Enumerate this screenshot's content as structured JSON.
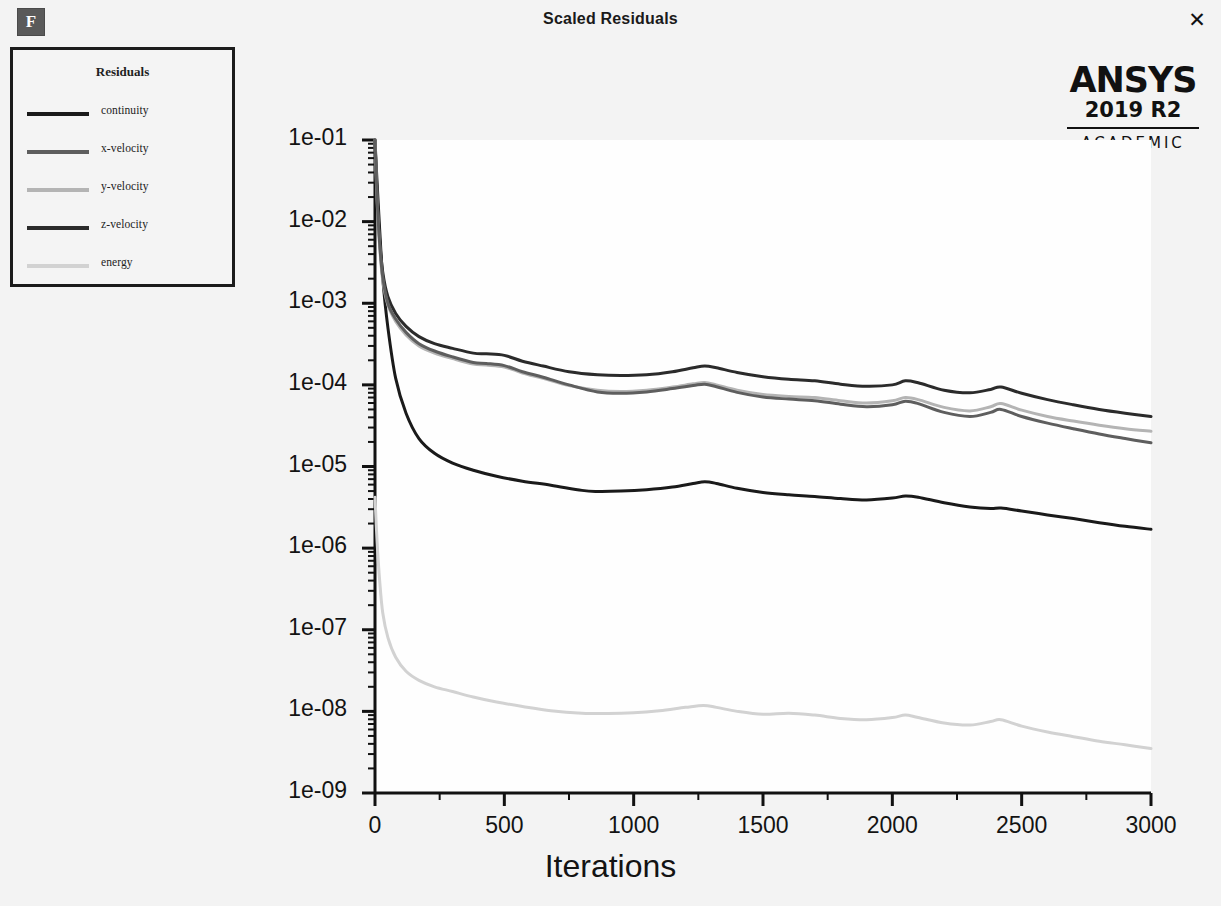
{
  "window": {
    "title": "Scaled Residuals",
    "icon": "fluent-f-icon",
    "icon_letter": "F",
    "close_label": "✕"
  },
  "branding": {
    "name": "ANSYS",
    "version": "2019 R2",
    "license": "ACADEMIC"
  },
  "legend": {
    "title": "Residuals",
    "items": [
      {
        "label": "continuity",
        "color": "#1a1a1a"
      },
      {
        "label": "x-velocity",
        "color": "#5e5e5e"
      },
      {
        "label": "y-velocity",
        "color": "#b4b4b4"
      },
      {
        "label": "z-velocity",
        "color": "#2b2b2b"
      },
      {
        "label": "energy",
        "color": "#d2d2d2"
      }
    ]
  },
  "chart_data": {
    "type": "line",
    "title": "Scaled Residuals",
    "xlabel": "Iterations",
    "ylabel": "",
    "xlim": [
      0,
      3000
    ],
    "ylim": [
      1e-09,
      0.1
    ],
    "yscale": "log",
    "grid": false,
    "legend_position": "top-left",
    "xticks": [
      0,
      500,
      1000,
      1500,
      2000,
      2500,
      3000
    ],
    "xtick_labels": [
      "0",
      "500",
      "1000",
      "1500",
      "2000",
      "2500",
      "3000"
    ],
    "xminor_step": 250,
    "yticks": [
      0.1,
      0.01,
      0.001,
      0.0001,
      1e-05,
      1e-06,
      1e-07,
      1e-08,
      1e-09
    ],
    "ytick_labels": [
      "1e-01",
      "1e-02",
      "1e-03",
      "1e-04",
      "1e-05",
      "1e-06",
      "1e-07",
      "1e-08",
      "1e-09"
    ],
    "series": [
      {
        "name": "continuity",
        "color": "#1a1a1a",
        "width": 3.0,
        "x": [
          0,
          8,
          18,
          30,
          50,
          80,
          120,
          170,
          230,
          300,
          380,
          470,
          570,
          680,
          800,
          860,
          950,
          1050,
          1150,
          1230,
          1275,
          1320,
          1400,
          1500,
          1600,
          1700,
          1800,
          1900,
          2000,
          2050,
          2100,
          2200,
          2300,
          2380,
          2420,
          2500,
          2600,
          2700,
          2800,
          2900,
          3000
        ],
        "y": [
          0.1,
          0.03,
          0.008,
          0.002,
          0.0005,
          0.00012,
          4.5e-05,
          2.2e-05,
          1.45e-05,
          1.1e-05,
          9e-06,
          7.6e-06,
          6.6e-06,
          5.9e-06,
          5.1e-06,
          4.95e-06,
          5e-06,
          5.2e-06,
          5.6e-06,
          6.2e-06,
          6.5e-06,
          6.2e-06,
          5.4e-06,
          4.8e-06,
          4.5e-06,
          4.3e-06,
          4.05e-06,
          3.9e-06,
          4.1e-06,
          4.35e-06,
          4.2e-06,
          3.6e-06,
          3.2e-06,
          3.05e-06,
          3.1e-06,
          2.85e-06,
          2.55e-06,
          2.3e-06,
          2.05e-06,
          1.85e-06,
          1.7e-06
        ]
      },
      {
        "name": "z-velocity",
        "color": "#2b2b2b",
        "width": 3.0,
        "x": [
          0,
          8,
          18,
          30,
          50,
          80,
          120,
          170,
          230,
          300,
          380,
          430,
          500,
          570,
          650,
          750,
          860,
          950,
          1050,
          1150,
          1230,
          1275,
          1320,
          1400,
          1500,
          1600,
          1700,
          1800,
          1900,
          2000,
          2050,
          2100,
          2200,
          2300,
          2380,
          2420,
          2500,
          2600,
          2700,
          2800,
          2900,
          3000
        ],
        "y": [
          0.1,
          0.022,
          0.006,
          0.0024,
          0.0012,
          0.00075,
          0.00052,
          0.00039,
          0.00032,
          0.00028,
          0.000245,
          0.00024,
          0.00023,
          0.000195,
          0.00017,
          0.000145,
          0.000133,
          0.00013,
          0.000133,
          0.000145,
          0.000162,
          0.00017,
          0.000162,
          0.000142,
          0.000126,
          0.000117,
          0.000112,
          0.000102,
          9.6e-05,
          0.0001,
          0.000112,
          0.000106,
          8.6e-05,
          8e-05,
          8.8e-05,
          9.4e-05,
          7.9e-05,
          6.6e-05,
          5.7e-05,
          5e-05,
          4.5e-05,
          4.1e-05
        ]
      },
      {
        "name": "y-velocity",
        "color": "#b4b4b4",
        "width": 3.0,
        "x": [
          0,
          8,
          18,
          30,
          50,
          80,
          120,
          170,
          230,
          300,
          380,
          430,
          500,
          570,
          650,
          750,
          860,
          950,
          1050,
          1150,
          1230,
          1275,
          1320,
          1400,
          1500,
          1600,
          1700,
          1800,
          1900,
          2000,
          2050,
          2100,
          2200,
          2300,
          2380,
          2420,
          2500,
          2600,
          2700,
          2800,
          2900,
          3000
        ],
        "y": [
          0.1,
          0.018,
          0.005,
          0.0019,
          0.00095,
          0.0006,
          0.00041,
          0.0003,
          0.000245,
          0.00021,
          0.00018,
          0.000175,
          0.000166,
          0.00014,
          0.00012,
          9.8e-05,
          8.6e-05,
          8.3e-05,
          8.6e-05,
          9.4e-05,
          0.000103,
          0.000107,
          0.0001,
          8.6e-05,
          7.6e-05,
          7.2e-05,
          7e-05,
          6.4e-05,
          6e-05,
          6.4e-05,
          7e-05,
          6.6e-05,
          5.3e-05,
          4.8e-05,
          5.4e-05,
          5.9e-05,
          4.9e-05,
          4.1e-05,
          3.6e-05,
          3.2e-05,
          2.9e-05,
          2.7e-05
        ]
      },
      {
        "name": "x-velocity",
        "color": "#5e5e5e",
        "width": 3.0,
        "x": [
          0,
          8,
          18,
          30,
          50,
          80,
          120,
          170,
          230,
          300,
          380,
          430,
          500,
          570,
          650,
          750,
          860,
          950,
          1050,
          1150,
          1230,
          1275,
          1320,
          1400,
          1500,
          1600,
          1700,
          1800,
          1900,
          2000,
          2050,
          2100,
          2200,
          2300,
          2380,
          2420,
          2500,
          2600,
          2700,
          2800,
          2900,
          3000
        ],
        "y": [
          0.1,
          0.02,
          0.0054,
          0.0021,
          0.001,
          0.00064,
          0.00044,
          0.00032,
          0.00026,
          0.00022,
          0.000188,
          0.000183,
          0.000172,
          0.000145,
          0.000124,
          0.0001,
          8.2e-05,
          7.9e-05,
          8.2e-05,
          9e-05,
          9.8e-05,
          0.000102,
          9.5e-05,
          8.1e-05,
          7.1e-05,
          6.7e-05,
          6.4e-05,
          5.8e-05,
          5.4e-05,
          5.7e-05,
          6.3e-05,
          5.9e-05,
          4.6e-05,
          4.1e-05,
          4.6e-05,
          5e-05,
          4.1e-05,
          3.4e-05,
          2.9e-05,
          2.5e-05,
          2.2e-05,
          1.95e-05
        ]
      },
      {
        "name": "energy",
        "color": "#d2d2d2",
        "width": 3.0,
        "x": [
          0,
          8,
          18,
          30,
          50,
          80,
          120,
          170,
          230,
          300,
          380,
          470,
          570,
          680,
          800,
          900,
          1000,
          1100,
          1200,
          1270,
          1320,
          1400,
          1500,
          1600,
          1700,
          1800,
          1900,
          2000,
          2050,
          2100,
          2200,
          2300,
          2380,
          2420,
          2500,
          2600,
          2700,
          2800,
          2900,
          3000
        ],
        "y": [
          4.2e-06,
          1.2e-06,
          4e-07,
          1.6e-07,
          8e-08,
          4.6e-08,
          3.1e-08,
          2.4e-08,
          2e-08,
          1.75e-08,
          1.5e-08,
          1.3e-08,
          1.15e-08,
          1.02e-08,
          9.5e-09,
          9.4e-09,
          9.6e-09,
          1.02e-08,
          1.12e-08,
          1.18e-08,
          1.12e-08,
          1e-08,
          9.2e-09,
          9.5e-09,
          9e-09,
          8.2e-09,
          7.9e-09,
          8.4e-09,
          9e-09,
          8.4e-09,
          7.2e-09,
          6.8e-09,
          7.5e-09,
          7.9e-09,
          6.6e-09,
          5.6e-09,
          4.9e-09,
          4.3e-09,
          3.9e-09,
          3.5e-09
        ]
      }
    ]
  }
}
